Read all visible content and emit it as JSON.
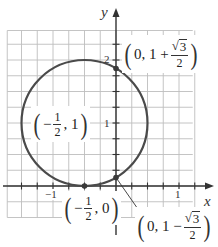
{
  "diagram": {
    "type": "circle-on-coordinate-grid",
    "colors": {
      "grid": "#bdbdbd",
      "axes": "#333333",
      "circle": "#4a4a4a",
      "point": "#3a3a3a",
      "background": "#ffffff"
    },
    "axes": {
      "x_label": "x",
      "y_label": "y",
      "x_tick_labels": {
        "neg_one": "−1",
        "one": "1"
      },
      "y_tick_labels": {
        "one": "1",
        "two": "2"
      },
      "x_range": [
        -1.75,
        1.25
      ],
      "y_range": [
        -0.5,
        2.5
      ],
      "grid_step": 0.25
    },
    "circle": {
      "center": [
        -0.5,
        1
      ],
      "radius": 1
    },
    "points": {
      "center": {
        "coords": [
          -0.5,
          1
        ],
        "label_open": "(",
        "label_sign": "−",
        "label_num": "1",
        "label_den": "2",
        "label_rest": ", 1",
        "label_close": ")"
      },
      "bottom": {
        "coords": [
          -0.5,
          0
        ],
        "label_open": "(",
        "label_sign": "−",
        "label_num": "1",
        "label_den": "2",
        "label_rest": ", 0",
        "label_close": ")"
      },
      "upper_y_intercept": {
        "coords": [
          0,
          1.866
        ],
        "label_open": "(",
        "label_pre": "0, 1 +",
        "label_radical": "√",
        "label_radicand": "3",
        "label_den": "2",
        "label_close": ")"
      },
      "lower_y_intercept": {
        "coords": [
          0,
          0.134
        ],
        "label_open": "(",
        "label_pre": "0, 1 −",
        "label_radical": "√",
        "label_radicand": "3",
        "label_den": "2",
        "label_close": ")"
      }
    }
  }
}
